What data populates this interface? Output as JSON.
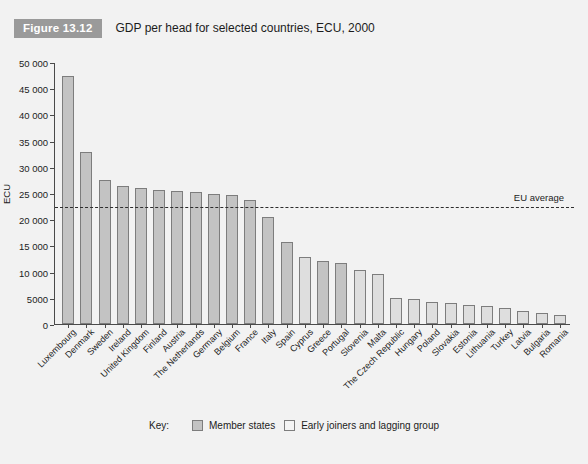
{
  "figure": {
    "badge": "Figure 13.12",
    "title": "GDP per head for selected countries, ECU, 2000"
  },
  "legend": {
    "key_label": "Key:",
    "entries": [
      {
        "label": "Member states",
        "color": "#c3c3c3",
        "group": "member"
      },
      {
        "label": "Early joiners and lagging group",
        "color": "#f4f4f4",
        "group": "joiner"
      }
    ]
  },
  "annotations": {
    "eu_average_label": "EU average",
    "eu_average_value": 22500
  },
  "chart_data": {
    "type": "bar",
    "title": "GDP per head for selected countries, ECU, 2000",
    "xlabel": "",
    "ylabel": "ECU",
    "ylim": [
      0,
      50000
    ],
    "ytick_values": [
      0,
      5000,
      10000,
      15000,
      20000,
      25000,
      30000,
      35000,
      40000,
      45000,
      50000
    ],
    "ytick_labels": [
      "0",
      "5000",
      "10 000",
      "15 000",
      "20 000",
      "25 000",
      "30 000",
      "35 000",
      "40 000",
      "45 000",
      "50 000"
    ],
    "grid": false,
    "legend_position": "bottom",
    "categories": [
      "Luxembourg",
      "Denmark",
      "Sweden",
      "Ireland",
      "United Kingdom",
      "Finland",
      "Austria",
      "The Netherlands",
      "Germany",
      "Belgium",
      "France",
      "Italy",
      "Spain",
      "Cyprus",
      "Greece",
      "Portugal",
      "Slovenia",
      "Malta",
      "The Czech Republic",
      "Hungary",
      "Poland",
      "Slovakia",
      "Estonia",
      "Lithuania",
      "Turkey",
      "Latvia",
      "Bulgaria",
      "Romania"
    ],
    "values": [
      47500,
      33000,
      27500,
      26500,
      26000,
      25700,
      25400,
      25300,
      25000,
      24800,
      23800,
      20500,
      15700,
      12900,
      12000,
      11700,
      10400,
      9500,
      5000,
      4800,
      4300,
      4000,
      3700,
      3400,
      3100,
      2500,
      2200,
      1700
    ],
    "series_groups": [
      "member",
      "member",
      "member",
      "member",
      "member",
      "member",
      "member",
      "member",
      "member",
      "member",
      "member",
      "member",
      "member",
      "joiner",
      "member",
      "member",
      "joiner",
      "joiner",
      "joiner",
      "joiner",
      "joiner",
      "joiner",
      "joiner",
      "joiner",
      "joiner",
      "joiner",
      "joiner",
      "joiner"
    ],
    "annotations": [
      {
        "type": "hline",
        "label": "EU average",
        "value": 22500
      }
    ]
  }
}
